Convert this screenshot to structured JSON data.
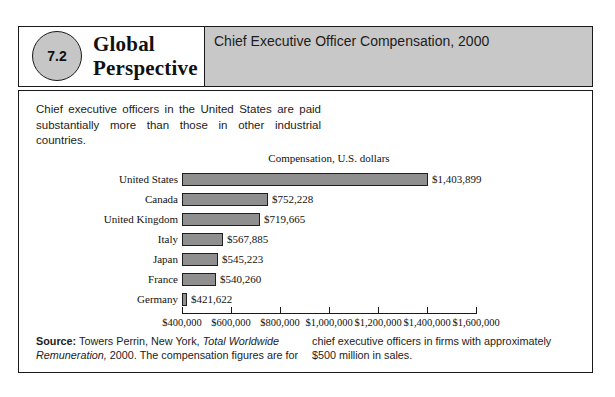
{
  "header": {
    "number": "7.2",
    "series_title_line1": "Global",
    "series_title_line2": "Perspective",
    "title": "Chief Executive Officer Compensation, 2000"
  },
  "intro": {
    "text": "Chief executive officers in the United States are paid substantially more than those in other industrial countries."
  },
  "chart_data": {
    "type": "bar",
    "orientation": "horizontal",
    "title": "Compensation, U.S. dollars",
    "categories": [
      "United States",
      "Canada",
      "United Kingdom",
      "Italy",
      "Japan",
      "France",
      "Germany"
    ],
    "values": [
      1403899,
      752228,
      719665,
      567885,
      545223,
      540260,
      421622
    ],
    "value_labels": [
      "$1,403,899",
      "$752,228",
      "$719,665",
      "$567,885",
      "$545,223",
      "$540,260",
      "$421,622"
    ],
    "xlim": [
      400000,
      1600000
    ],
    "tick_values": [
      400000,
      600000,
      800000,
      1000000,
      1200000,
      1400000,
      1600000
    ],
    "tick_labels": [
      "$400,000",
      "$600,000",
      "$800,000",
      "$1,000,000",
      "$1,200,000",
      "$1,400,000",
      "$1,600,000"
    ],
    "grid": false,
    "legend": false,
    "bar_color": "#8f8f8f",
    "bar_border_color": "#1f1f1f"
  },
  "source": {
    "label": "Source:",
    "text_before_italic": " Towers Perrin, New York, ",
    "italic_text": "Total Worldwide Remuneration,",
    "text_after_italic": " 2000. The compensation figures are for",
    "column2_text": "chief executive officers in firms with approximately $500 million in sales."
  },
  "colors": {
    "header_band": "#c8c8c8",
    "badge_fill": "#c6c6c6"
  }
}
